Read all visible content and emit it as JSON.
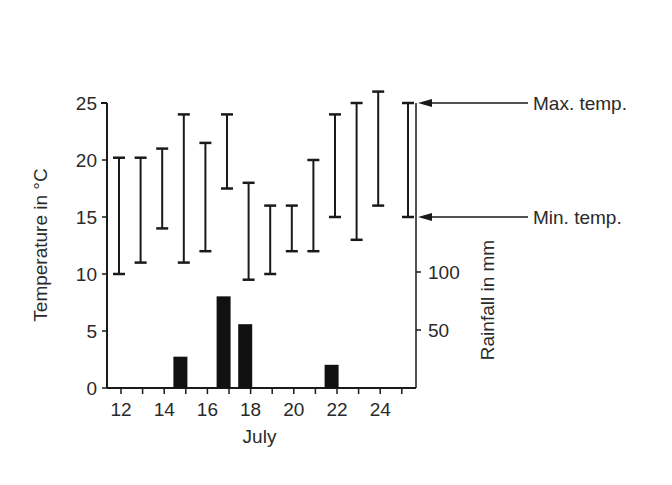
{
  "chart_data": {
    "type": "bar",
    "title": "",
    "xlabel": "July",
    "ylabel": "Temperature in °C",
    "y2label": "Rainfall in mm",
    "x_ticks": [
      "12",
      "14",
      "16",
      "18",
      "20",
      "22",
      "24"
    ],
    "y_ticks": [
      "0",
      "5",
      "10",
      "15",
      "20",
      "25"
    ],
    "y2_ticks": [
      "50",
      "100"
    ],
    "ylim": [
      0,
      25
    ],
    "y2lim": [
      0,
      100
    ],
    "xlim": [
      11.5,
      25.5
    ],
    "grid": false,
    "days": [
      12,
      13,
      14,
      15,
      16,
      17,
      18,
      19,
      20,
      21,
      22,
      23,
      24,
      25
    ],
    "series": [
      {
        "name": "Max. temp.",
        "type": "range_max",
        "values": [
          20.2,
          20.2,
          21,
          24,
          21.5,
          24,
          18,
          16,
          16,
          20,
          24,
          25,
          26,
          25
        ]
      },
      {
        "name": "Min. temp.",
        "type": "range_min",
        "values": [
          10,
          11,
          14,
          11,
          12,
          17.5,
          9.5,
          10,
          12,
          12,
          15,
          13,
          16,
          15
        ]
      },
      {
        "name": "Rainfall",
        "type": "bar",
        "axis": "y2",
        "x": [
          14.75,
          16.75,
          17.75,
          21.75
        ],
        "values": [
          27,
          79,
          55,
          20
        ]
      }
    ],
    "annotations": [
      {
        "text": "Max. temp.",
        "points_to": "top of day-25 range bar"
      },
      {
        "text": "Min. temp.",
        "points_to": "bottom of day-25 range bar"
      }
    ]
  }
}
